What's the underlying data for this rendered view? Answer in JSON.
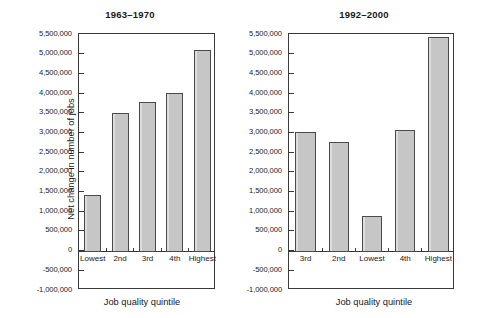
{
  "figure": {
    "ylabel": "Net change in number of jobs",
    "xlabel": "Job quality quintile",
    "yticks": [
      "5,500,000",
      "5,000,000",
      "4,500,000",
      "4,000,000",
      "3,500,000",
      "3,000,000",
      "2,500,000",
      "2,000,000",
      "1,500,000",
      "1,000,000",
      "500,000",
      "0",
      "-500,000",
      "-1,000,000"
    ],
    "bar_fill": "#c6c6c6",
    "bar_edge": "#4a4a4a"
  },
  "panels": [
    {
      "title": "1963–1970",
      "categories": [
        "Lowest",
        "2nd",
        "3rd",
        "4th",
        "Highest"
      ],
      "values": [
        1400000,
        3500000,
        3770000,
        4000000,
        5100000
      ]
    },
    {
      "title": "1992–2000",
      "categories": [
        "3rd",
        "2nd",
        "Lowest",
        "4th",
        "Highest"
      ],
      "values": [
        3000000,
        2750000,
        870000,
        3050000,
        5420000
      ]
    }
  ],
  "chart_data": {
    "type": "bar",
    "title": "",
    "subtitle": "",
    "xlabel": "Job quality quintile",
    "ylabel": "Net change in number of jobs",
    "ylim": [
      -1000000,
      5500000
    ],
    "ytick_step": 500000,
    "ytick_labels": [
      "5,500,000",
      "5,000,000",
      "4,500,000",
      "4,000,000",
      "3,500,000",
      "3,000,000",
      "2,500,000",
      "2,000,000",
      "1,500,000",
      "1,000,000",
      "500,000",
      "0",
      "-500,000",
      "-1,000,000"
    ],
    "grid": false,
    "legend": "none",
    "panels": [
      {
        "title": "1963–1970",
        "categories": [
          "Lowest",
          "2nd",
          "3rd",
          "4th",
          "Highest"
        ],
        "values": [
          1400000,
          3500000,
          3770000,
          4000000,
          5100000
        ]
      },
      {
        "title": "1992–2000",
        "categories": [
          "3rd",
          "2nd",
          "Lowest",
          "4th",
          "Highest"
        ],
        "values": [
          3000000,
          2750000,
          870000,
          3050000,
          5420000
        ]
      }
    ]
  }
}
